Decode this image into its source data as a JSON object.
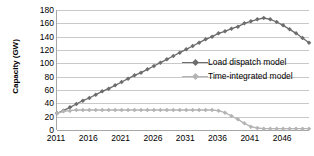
{
  "chart_data": {
    "type": "line",
    "title": "",
    "xlabel": "",
    "ylabel": "Capacity (GW)",
    "xlim": [
      2011,
      2050
    ],
    "ylim": [
      0,
      180
    ],
    "ytick_step": 20,
    "grid": true,
    "legend_position": "center-right",
    "yticks": [
      "0",
      "20",
      "40",
      "60",
      "80",
      "100",
      "120",
      "140",
      "160",
      "180"
    ],
    "xticks": [
      "2011",
      "2016",
      "2021",
      "2026",
      "2031",
      "2036",
      "2041",
      "2046"
    ],
    "x": [
      2011,
      2012,
      2013,
      2014,
      2015,
      2016,
      2017,
      2018,
      2019,
      2020,
      2021,
      2022,
      2023,
      2024,
      2025,
      2026,
      2027,
      2028,
      2029,
      2030,
      2031,
      2032,
      2033,
      2034,
      2035,
      2036,
      2037,
      2038,
      2039,
      2040,
      2041,
      2042,
      2043,
      2044,
      2045,
      2046,
      2047,
      2048,
      2049,
      2050
    ],
    "series": [
      {
        "name": "Load dispatch model",
        "color": "#6d6d6d",
        "marker": "diamond",
        "values": [
          25,
          29,
          34,
          39,
          44,
          48,
          53,
          58,
          62,
          67,
          72,
          77,
          82,
          86,
          91,
          96,
          101,
          106,
          111,
          116,
          121,
          126,
          131,
          136,
          140,
          145,
          148,
          152,
          155,
          160,
          163,
          166,
          168,
          166,
          162,
          157,
          151,
          145,
          138,
          131
        ]
      },
      {
        "name": "Time-integrated model",
        "color": "#b4b4b4",
        "marker": "diamond",
        "values": [
          25,
          28,
          29,
          30,
          30,
          30,
          30,
          30,
          30,
          30,
          30,
          30,
          30,
          30,
          30,
          30,
          30,
          30,
          30,
          30,
          30,
          30,
          30,
          30,
          30,
          29,
          26,
          21,
          16,
          10,
          5,
          3,
          2,
          2,
          2,
          2,
          2,
          2,
          2,
          2
        ]
      }
    ]
  },
  "legend": {
    "entries": [
      {
        "label": "Load dispatch model",
        "color": "#6d6d6d"
      },
      {
        "label": "Time-integrated model",
        "color": "#b4b4b4"
      }
    ]
  },
  "colors": {
    "gridline": "#c9c9c9",
    "axis": "#a6a6a6",
    "series_primary": "#6d6d6d",
    "series_secondary": "#b4b4b4",
    "text": "#000000",
    "background": "#ffffff"
  }
}
